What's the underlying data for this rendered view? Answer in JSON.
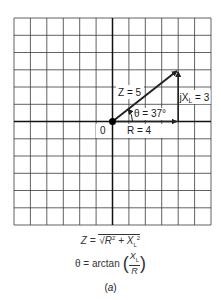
{
  "diagram": {
    "type": "phasor-impedance-triangle",
    "grid": {
      "columns": 12,
      "rows": 12,
      "line_color": "#333333",
      "axis_color": "#111111"
    },
    "origin_label": "0",
    "vectors": {
      "Z": {
        "label": "Z = 5",
        "magnitude": 5
      },
      "R": {
        "label": "R = 4",
        "magnitude": 4
      },
      "XL": {
        "label_prefix": "jX",
        "label_sub": "L",
        "label_suffix": " = 3",
        "magnitude": 3
      }
    },
    "angle": {
      "label": "θ = 37°",
      "degrees": 37
    },
    "formulas": {
      "z_formula": "Z = √R² + X_L²",
      "z_lhs": "Z = ",
      "z_rhs_R": "R",
      "z_rhs_plus": " + X",
      "z_sub": "L",
      "theta_formula": "θ = arctan (X_L / R)",
      "theta_lhs": "θ = arctan",
      "theta_num": "X",
      "theta_num_sub": "L",
      "theta_den": "R"
    },
    "caption": "(a)",
    "caption_letter": "a"
  }
}
